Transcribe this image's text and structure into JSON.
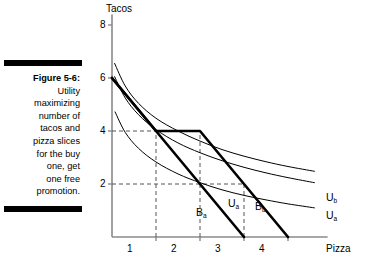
{
  "figure": {
    "number": "Figure 5-6:",
    "caption_lines": [
      "Utility",
      "maximizing",
      "number of",
      "tacos and",
      "pizza slices",
      "for the buy",
      "one, get",
      "one free",
      "promotion."
    ],
    "caption_full": "Figure 5-6: Utility maximizing number of tacos and pizza slices for the buy one, get one free promotion."
  },
  "axes": {
    "y_title": "Tacos",
    "x_title": "Pizza",
    "y_ticks": [
      "8",
      "6",
      "4",
      "2"
    ],
    "x_ticks": [
      "1",
      "2",
      "3",
      "4"
    ]
  },
  "labels": {
    "budget_a": "B",
    "budget_a_sub": "a",
    "budget_b": "B",
    "budget_b_sub": "b",
    "utility_a_inner": "U",
    "utility_a_inner_sub": "a",
    "utility_b_right": "U",
    "utility_b_right_sub": "b",
    "utility_a_right": "U",
    "utility_a_right_sub": "a"
  },
  "chart_data": {
    "type": "line",
    "title": "Utility maximizing number of tacos and pizza slices for the buy one, get one free promotion.",
    "xlabel": "Pizza",
    "ylabel": "Tacos",
    "xlim": [
      0,
      4.9
    ],
    "ylim": [
      0,
      8.4
    ],
    "xticks": [
      1,
      2,
      3,
      4
    ],
    "yticks": [
      2,
      4,
      6,
      8
    ],
    "grid": false,
    "legend": "inline-curve-labels",
    "series": [
      {
        "name": "B_a",
        "role": "budget-line-original",
        "style": "solid-bold",
        "points": [
          [
            0,
            6
          ],
          [
            3,
            0
          ]
        ]
      },
      {
        "name": "B_b",
        "role": "budget-line-bogo-kinked",
        "style": "solid-bold",
        "points": [
          [
            0,
            6
          ],
          [
            1,
            4
          ],
          [
            2,
            4
          ],
          [
            4,
            0
          ]
        ]
      },
      {
        "name": "U_a",
        "role": "indifference-curve-lower",
        "style": "solid-thin",
        "points": [
          [
            0.07,
            4.72
          ],
          [
            0.3,
            3.95
          ],
          [
            0.6,
            3.35
          ],
          [
            1.0,
            2.83
          ],
          [
            1.5,
            2.38
          ],
          [
            2.0,
            2.05
          ],
          [
            2.5,
            1.78
          ],
          [
            3.0,
            1.57
          ],
          [
            3.5,
            1.4
          ],
          [
            4.0,
            1.25
          ],
          [
            4.6,
            1.1
          ]
        ]
      },
      {
        "name": "U_b",
        "role": "indifference-curve-upper",
        "style": "solid-thin",
        "points": [
          [
            0.06,
            6.55
          ],
          [
            0.3,
            5.7
          ],
          [
            0.6,
            5.05
          ],
          [
            1.0,
            4.48
          ],
          [
            1.5,
            4.0
          ],
          [
            2.0,
            3.62
          ],
          [
            2.5,
            3.3
          ],
          [
            3.0,
            3.05
          ],
          [
            3.5,
            2.84
          ],
          [
            4.0,
            2.66
          ],
          [
            4.6,
            2.48
          ]
        ]
      },
      {
        "name": "U_a_outer",
        "role": "indifference-curve-middle",
        "style": "solid-thin",
        "points": [
          [
            0.06,
            6.05
          ],
          [
            0.3,
            5.25
          ],
          [
            0.6,
            4.62
          ],
          [
            1.0,
            4.05
          ],
          [
            1.5,
            3.55
          ],
          [
            2.0,
            3.18
          ],
          [
            2.5,
            2.88
          ],
          [
            3.0,
            2.63
          ],
          [
            3.5,
            2.42
          ],
          [
            4.0,
            2.24
          ],
          [
            4.6,
            2.05
          ]
        ]
      }
    ],
    "guides": [
      {
        "type": "dashed-horizontal",
        "y": 4,
        "from_x": 0,
        "to_x": 2
      },
      {
        "type": "dashed-horizontal",
        "y": 2,
        "from_x": 0,
        "to_x": 3
      },
      {
        "type": "dashed-vertical",
        "x": 1,
        "from_y": 0,
        "to_y": 4
      },
      {
        "type": "dashed-vertical",
        "x": 2,
        "from_y": 0,
        "to_y": 4
      },
      {
        "type": "dashed-vertical",
        "x": 3,
        "from_y": 0,
        "to_y": 2
      }
    ],
    "annotations": [
      {
        "text": "optimal bundle with BOGO",
        "x": 2,
        "y": 4
      },
      {
        "text": "optimal bundle without promotion",
        "x": 1,
        "y": 4
      }
    ]
  }
}
